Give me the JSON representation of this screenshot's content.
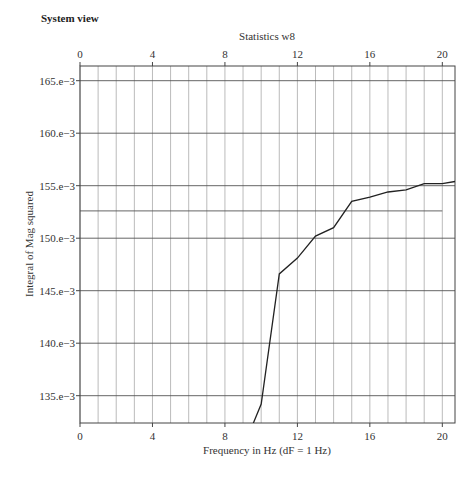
{
  "header": {
    "title": "System view"
  },
  "chart_data": {
    "type": "line",
    "title": "Statistics w8",
    "xlabel": "Frequency in Hz (dF = 1 Hz)",
    "ylabel": "Integral of Mag squared",
    "xlim": [
      0,
      20.7
    ],
    "ylim": [
      0.1324,
      0.1664
    ],
    "x_ticks": [
      0,
      4,
      8,
      12,
      16,
      20
    ],
    "x_tick_labels": [
      "0",
      "4",
      "8",
      "12",
      "16",
      "20"
    ],
    "x_minor_step": 1,
    "y_ticks": [
      0.135,
      0.14,
      0.145,
      0.15,
      0.155,
      0.16,
      0.165
    ],
    "y_tick_labels": [
      "135.e−3",
      "140.e−3",
      "145.e−3",
      "150.e−3",
      "155.e−3",
      "160.e−3",
      "165.e−3"
    ],
    "grid": true,
    "top_axis_duplicate": true,
    "reference_line": {
      "y": 0.1526,
      "x_from": 0,
      "x_to": 20
    },
    "series": [
      {
        "name": "Integral of Mag squared",
        "x": [
          9,
          10,
          11,
          12,
          13,
          14,
          15,
          16,
          17,
          18,
          19,
          20,
          20.7
        ],
        "values": [
          0.13,
          0.1342,
          0.1466,
          0.1481,
          0.1502,
          0.151,
          0.1535,
          0.1539,
          0.1544,
          0.1546,
          0.1552,
          0.1552,
          0.1554
        ]
      }
    ]
  },
  "colors": {
    "line": "#222222",
    "major_grid": "#555555",
    "minor_grid": "#aaaaaa",
    "frame": "#444444"
  }
}
